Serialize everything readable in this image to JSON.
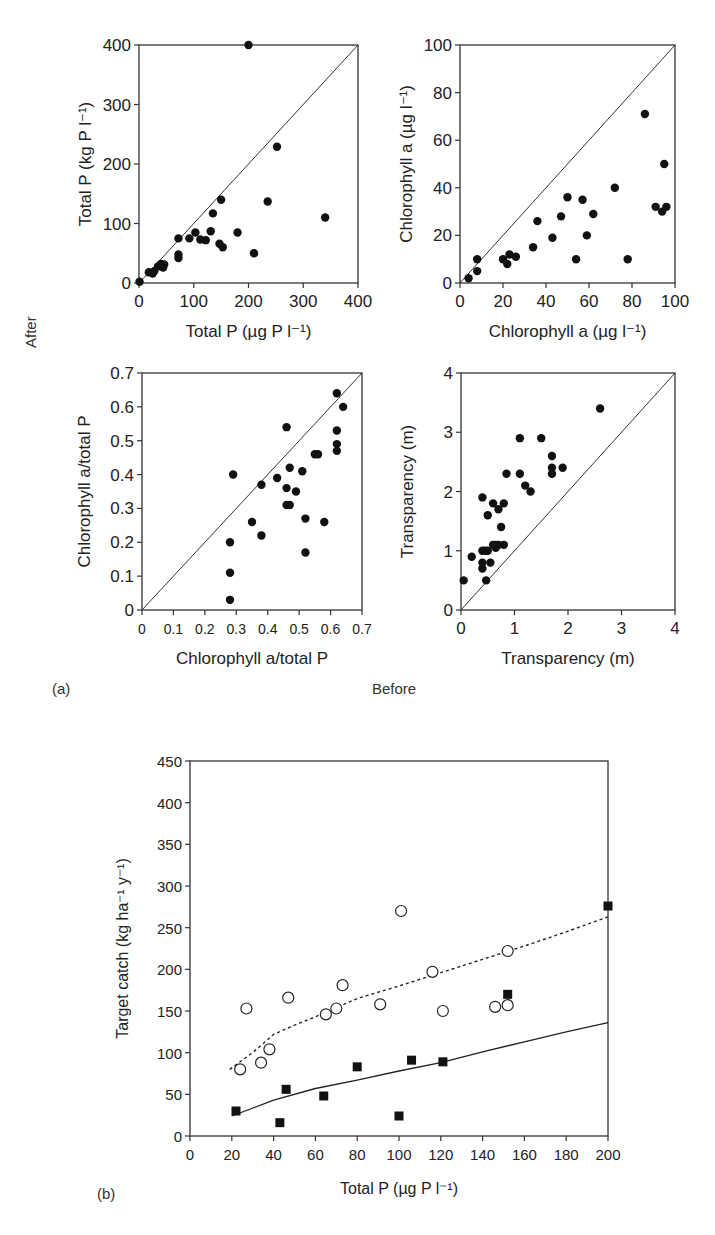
{
  "labels": {
    "panel_a": "(a)",
    "panel_b": "(b)",
    "before": "Before",
    "after": "After"
  },
  "chart_data": [
    {
      "id": "tp",
      "type": "scatter",
      "panel": "a",
      "box": [
        139,
        45,
        358,
        283
      ],
      "xlim": [
        0,
        400
      ],
      "ylim": [
        0,
        400
      ],
      "xticks": [
        0,
        100,
        200,
        300,
        400
      ],
      "yticks": [
        0,
        100,
        200,
        300,
        400
      ],
      "tick_labels_x": [
        "0",
        "100",
        "200",
        "300",
        "400"
      ],
      "tick_labels_y": [
        "0",
        "100",
        "200",
        "300",
        "400"
      ],
      "xlabel": "Total P (µg P l⁻¹)",
      "ylabel": "Total P (kg P l⁻¹)",
      "diagonal": true,
      "points": [
        [
          1,
          2
        ],
        [
          18,
          18
        ],
        [
          25,
          16
        ],
        [
          28,
          20
        ],
        [
          35,
          28
        ],
        [
          40,
          32
        ],
        [
          44,
          26
        ],
        [
          46,
          31
        ],
        [
          72,
          75
        ],
        [
          72,
          48
        ],
        [
          72,
          42
        ],
        [
          92,
          75
        ],
        [
          103,
          85
        ],
        [
          112,
          73
        ],
        [
          122,
          72
        ],
        [
          131,
          87
        ],
        [
          135,
          117
        ],
        [
          150,
          140
        ],
        [
          147,
          66
        ],
        [
          153,
          60
        ],
        [
          180,
          85
        ],
        [
          200,
          400
        ],
        [
          210,
          50
        ],
        [
          235,
          137
        ],
        [
          252,
          229
        ],
        [
          340,
          110
        ]
      ]
    },
    {
      "id": "chla",
      "type": "scatter",
      "panel": "a",
      "box": [
        460,
        45,
        675,
        283
      ],
      "xlim": [
        0,
        100
      ],
      "ylim": [
        0,
        100
      ],
      "xticks": [
        0,
        20,
        40,
        60,
        80,
        100
      ],
      "yticks": [
        0,
        20,
        40,
        60,
        80,
        100
      ],
      "tick_labels_x": [
        "0",
        "20",
        "40",
        "60",
        "80",
        "100"
      ],
      "tick_labels_y": [
        "0",
        "20",
        "40",
        "60",
        "80",
        "100"
      ],
      "xlabel": "Chlorophyll a (µg l⁻¹)",
      "ylabel": "Chlorophyll a (µg l⁻¹)",
      "diagonal": true,
      "points": [
        [
          4,
          2
        ],
        [
          8,
          5
        ],
        [
          8,
          10
        ],
        [
          20,
          10
        ],
        [
          22,
          8
        ],
        [
          23,
          12
        ],
        [
          26,
          11
        ],
        [
          34,
          15
        ],
        [
          36,
          26
        ],
        [
          43,
          19
        ],
        [
          47,
          28
        ],
        [
          50,
          36
        ],
        [
          54,
          10
        ],
        [
          57,
          35
        ],
        [
          59,
          20
        ],
        [
          62,
          29
        ],
        [
          72,
          40
        ],
        [
          78,
          10
        ],
        [
          86,
          71
        ],
        [
          91,
          32
        ],
        [
          95,
          50
        ],
        [
          94,
          30
        ],
        [
          96,
          32
        ]
      ]
    },
    {
      "id": "ratio",
      "type": "scatter",
      "panel": "a",
      "box": [
        142,
        373,
        362,
        610
      ],
      "xlim": [
        0,
        0.7
      ],
      "ylim": [
        0,
        0.7
      ],
      "xticks": [
        0,
        0.1,
        0.2,
        0.3,
        0.4,
        0.5,
        0.6,
        0.7
      ],
      "yticks": [
        0,
        0.1,
        0.2,
        0.3,
        0.4,
        0.5,
        0.6,
        0.7
      ],
      "tick_labels_x": [
        "0",
        "0.1",
        "0.2",
        "0.3",
        "0.4",
        "0.5",
        "0.6",
        "0.7"
      ],
      "tick_labels_y": [
        "0",
        "0.1",
        "0.2",
        "0.3",
        "0.4",
        "0.5",
        "0.6",
        "0.7"
      ],
      "xlabel": "Chlorophyll a/total P",
      "ylabel": "Chlorophyll a/total P",
      "diagonal": true,
      "points": [
        [
          0.28,
          0.2
        ],
        [
          0.28,
          0.11
        ],
        [
          0.28,
          0.03
        ],
        [
          0.29,
          0.4
        ],
        [
          0.35,
          0.26
        ],
        [
          0.38,
          0.37
        ],
        [
          0.38,
          0.22
        ],
        [
          0.43,
          0.39
        ],
        [
          0.46,
          0.54
        ],
        [
          0.46,
          0.36
        ],
        [
          0.46,
          0.31
        ],
        [
          0.47,
          0.31
        ],
        [
          0.47,
          0.42
        ],
        [
          0.49,
          0.35
        ],
        [
          0.51,
          0.41
        ],
        [
          0.52,
          0.27
        ],
        [
          0.52,
          0.17
        ],
        [
          0.55,
          0.46
        ],
        [
          0.56,
          0.46
        ],
        [
          0.58,
          0.26
        ],
        [
          0.62,
          0.64
        ],
        [
          0.62,
          0.53
        ],
        [
          0.62,
          0.49
        ],
        [
          0.62,
          0.47
        ],
        [
          0.64,
          0.6
        ]
      ]
    },
    {
      "id": "transp",
      "type": "scatter",
      "panel": "a",
      "box": [
        461,
        373,
        675,
        610
      ],
      "xlim": [
        0,
        4
      ],
      "ylim": [
        0,
        4
      ],
      "xticks": [
        0,
        1,
        2,
        3,
        4
      ],
      "yticks": [
        0,
        1,
        2,
        3,
        4
      ],
      "tick_labels_x": [
        "0",
        "1",
        "2",
        "3",
        "4"
      ],
      "tick_labels_y": [
        "0",
        "1",
        "2",
        "3",
        "4"
      ],
      "xlabel": "Transparency (m)",
      "ylabel": "Transparency (m)",
      "diagonal": true,
      "points": [
        [
          0.05,
          0.5
        ],
        [
          0.2,
          0.9
        ],
        [
          0.4,
          1.9
        ],
        [
          0.4,
          1.0
        ],
        [
          0.4,
          0.8
        ],
        [
          0.4,
          0.7
        ],
        [
          0.45,
          1.0
        ],
        [
          0.47,
          0.5
        ],
        [
          0.5,
          1.6
        ],
        [
          0.5,
          1.0
        ],
        [
          0.55,
          0.8
        ],
        [
          0.6,
          1.1
        ],
        [
          0.6,
          1.8
        ],
        [
          0.65,
          1.1
        ],
        [
          0.65,
          1.05
        ],
        [
          0.7,
          1.7
        ],
        [
          0.7,
          1.1
        ],
        [
          0.75,
          1.4
        ],
        [
          0.8,
          1.1
        ],
        [
          0.8,
          1.8
        ],
        [
          0.85,
          2.3
        ],
        [
          1.1,
          2.9
        ],
        [
          1.1,
          2.3
        ],
        [
          1.2,
          2.1
        ],
        [
          1.3,
          2.0
        ],
        [
          1.5,
          2.9
        ],
        [
          1.7,
          2.6
        ],
        [
          1.7,
          2.4
        ],
        [
          1.7,
          2.3
        ],
        [
          1.9,
          2.4
        ],
        [
          2.6,
          3.4
        ]
      ]
    },
    {
      "id": "catch",
      "type": "scatter",
      "panel": "b",
      "box": [
        190,
        761,
        608,
        1136
      ],
      "xlim": [
        0,
        200
      ],
      "ylim": [
        0,
        450
      ],
      "xticks": [
        0,
        20,
        40,
        60,
        80,
        100,
        120,
        140,
        160,
        180,
        200
      ],
      "yticks": [
        0,
        50,
        100,
        150,
        200,
        250,
        300,
        350,
        400,
        450
      ],
      "tick_labels_x": [
        "0",
        "20",
        "40",
        "60",
        "80",
        "100",
        "120",
        "140",
        "160",
        "180",
        "200"
      ],
      "tick_labels_y": [
        "0",
        "50",
        "100",
        "150",
        "200",
        "250",
        "300",
        "350",
        "400",
        "450"
      ],
      "xlabel": "Total P (µg P l⁻¹)",
      "ylabel": "Target catch (kg ha⁻¹ y⁻¹)",
      "diagonal": false,
      "series": [
        {
          "name": "open circles",
          "marker": "circle-open",
          "points": [
            [
              24,
              80
            ],
            [
              27,
              153
            ],
            [
              34,
              88
            ],
            [
              38,
              104
            ],
            [
              47,
              166
            ],
            [
              65,
              146
            ],
            [
              70,
              153
            ],
            [
              73,
              181
            ],
            [
              91,
              158
            ],
            [
              101,
              270
            ],
            [
              116,
              197
            ],
            [
              121,
              150
            ],
            [
              146,
              155
            ],
            [
              152,
              157
            ],
            [
              152,
              222
            ]
          ]
        },
        {
          "name": "filled squares",
          "marker": "square-filled",
          "points": [
            [
              22,
              30
            ],
            [
              43,
              16
            ],
            [
              46,
              56
            ],
            [
              64,
              48
            ],
            [
              80,
              83
            ],
            [
              100,
              24
            ],
            [
              106,
              91
            ],
            [
              121,
              89
            ],
            [
              152,
              170
            ],
            [
              200,
              276
            ]
          ]
        }
      ],
      "lines": [
        {
          "name": "dotted fit",
          "style": "dotted",
          "points": [
            [
              19,
              80
            ],
            [
              30,
              100
            ],
            [
              40,
              122
            ],
            [
              50,
              133
            ],
            [
              60,
              143
            ],
            [
              80,
              165
            ],
            [
              100,
              180
            ],
            [
              120,
              196
            ],
            [
              140,
              212
            ],
            [
              160,
              228
            ],
            [
              180,
              245
            ],
            [
              200,
              263
            ]
          ]
        },
        {
          "name": "solid fit",
          "style": "solid",
          "points": [
            [
              20,
              24
            ],
            [
              40,
              43
            ],
            [
              60,
              57
            ],
            [
              80,
              67
            ],
            [
              100,
              78
            ],
            [
              120,
              88
            ],
            [
              140,
              101
            ],
            [
              160,
              113
            ],
            [
              180,
              125
            ],
            [
              200,
              136
            ]
          ]
        }
      ]
    }
  ]
}
